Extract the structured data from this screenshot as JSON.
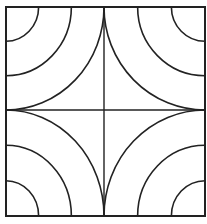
{
  "diagram": {
    "colors": {
      "stroke": "#222222",
      "background": "#ffffff"
    },
    "square": {
      "x": 6,
      "y": 7,
      "size": 199,
      "height": 209
    },
    "center": {
      "x": 104,
      "y": 110
    },
    "arc_radius_fractions": [
      0.333,
      0.667,
      1.0
    ],
    "corners": [
      "top-left",
      "top-right",
      "bottom-left",
      "bottom-right"
    ]
  }
}
